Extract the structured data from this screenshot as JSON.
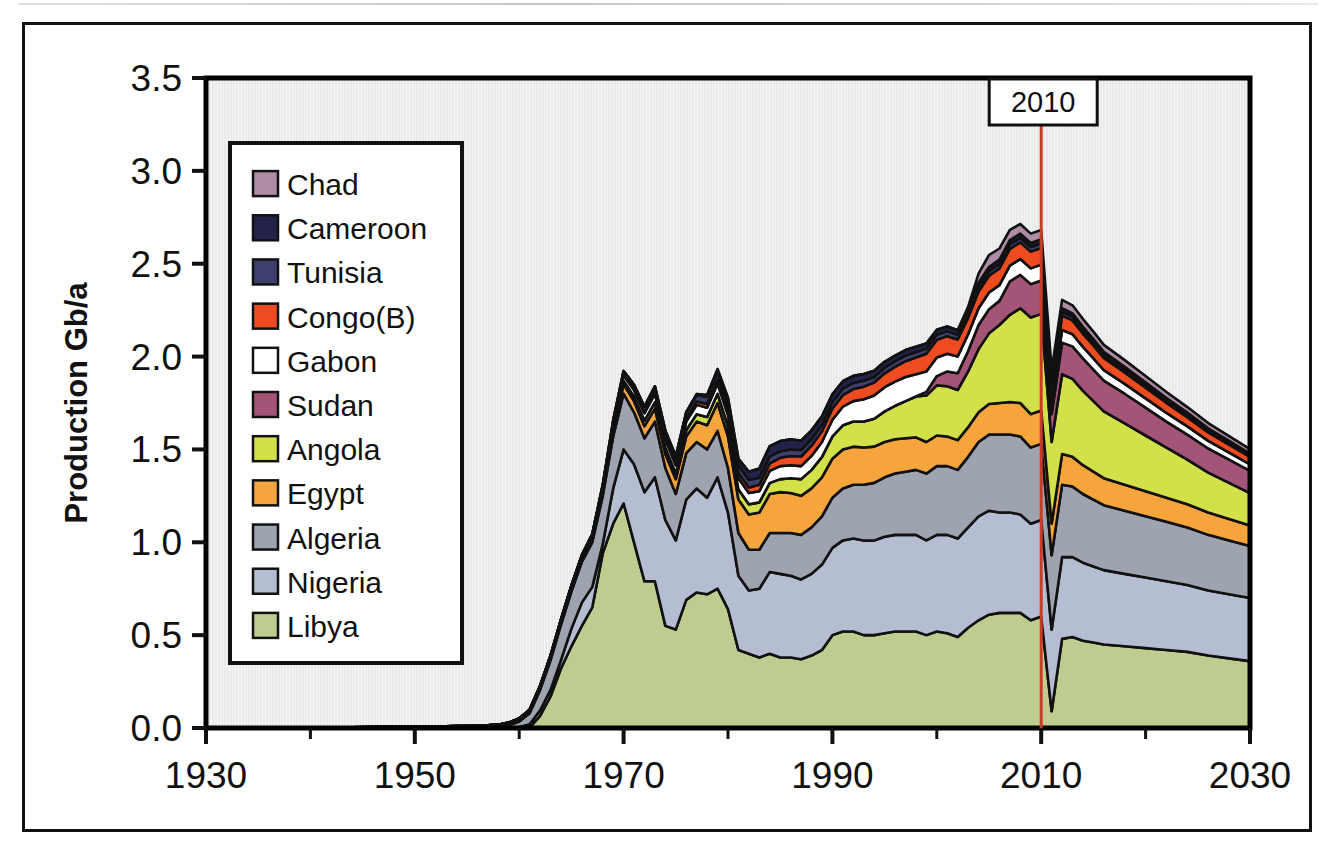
{
  "figure": {
    "background_color": "#ffffff",
    "frame_color": "#111111",
    "plot_background_color": "#e9ebeb",
    "plot_border_color": "#000000"
  },
  "chart_data": {
    "type": "area",
    "stacked": true,
    "title": "",
    "xlabel": "",
    "ylabel": "Production Gb/a",
    "xlim": [
      1930,
      2030
    ],
    "ylim": [
      0.0,
      3.5
    ],
    "grid": false,
    "legend_position": "upper-left-inside",
    "x_major_ticks": [
      1930,
      1950,
      1970,
      1990,
      2010,
      2030
    ],
    "x_minor_ticks": [
      1940,
      1960,
      1980,
      2000,
      2020
    ],
    "x_tick_labels": [
      "1930",
      "1950",
      "1970",
      "1990",
      "2010",
      "2030"
    ],
    "y_ticks": [
      0.0,
      0.5,
      1.0,
      1.5,
      2.0,
      2.5,
      3.0,
      3.5
    ],
    "y_tick_labels": [
      "0.0",
      "0.5",
      "1.0",
      "1.5",
      "2.0",
      "2.5",
      "3.0",
      "3.5"
    ],
    "stack_order_bottom_to_top": [
      "Libya",
      "Nigeria",
      "Algeria",
      "Egypt",
      "Angola",
      "Sudan",
      "Gabon",
      "Congo(B)",
      "Tunisia",
      "Cameroon",
      "Chad"
    ],
    "legend_order_top_to_bottom": [
      "Chad",
      "Cameroon",
      "Tunisia",
      "Congo(B)",
      "Gabon",
      "Sudan",
      "Angola",
      "Egypt",
      "Algeria",
      "Nigeria",
      "Libya"
    ],
    "x": [
      1930,
      1932,
      1934,
      1936,
      1938,
      1940,
      1942,
      1944,
      1946,
      1948,
      1950,
      1952,
      1954,
      1956,
      1957,
      1958,
      1959,
      1960,
      1961,
      1962,
      1963,
      1964,
      1965,
      1966,
      1967,
      1968,
      1969,
      1970,
      1971,
      1972,
      1973,
      1974,
      1975,
      1976,
      1977,
      1978,
      1979,
      1980,
      1981,
      1982,
      1983,
      1984,
      1985,
      1986,
      1987,
      1988,
      1989,
      1990,
      1991,
      1992,
      1993,
      1994,
      1995,
      1996,
      1997,
      1998,
      1999,
      2000,
      2001,
      2002,
      2003,
      2004,
      2005,
      2006,
      2007,
      2008,
      2009,
      2010,
      2011,
      2012,
      2013,
      2014,
      2015,
      2016,
      2018,
      2020,
      2022,
      2024,
      2026,
      2028,
      2030
    ],
    "series": [
      {
        "name": "Libya",
        "color": "#bfcc90",
        "values": [
          0,
          0,
          0,
          0,
          0,
          0,
          0,
          0,
          0,
          0,
          0,
          0,
          0,
          0,
          0,
          0,
          0,
          0,
          0.002,
          0.065,
          0.17,
          0.32,
          0.44,
          0.55,
          0.65,
          0.94,
          1.1,
          1.21,
          1.0,
          0.79,
          0.79,
          0.55,
          0.53,
          0.69,
          0.73,
          0.72,
          0.75,
          0.64,
          0.42,
          0.4,
          0.38,
          0.4,
          0.38,
          0.38,
          0.37,
          0.39,
          0.42,
          0.5,
          0.52,
          0.52,
          0.5,
          0.5,
          0.51,
          0.52,
          0.52,
          0.52,
          0.5,
          0.52,
          0.51,
          0.49,
          0.54,
          0.58,
          0.61,
          0.62,
          0.62,
          0.62,
          0.58,
          0.6,
          0.09,
          0.48,
          0.49,
          0.47,
          0.46,
          0.45,
          0.44,
          0.43,
          0.42,
          0.41,
          0.39,
          0.375,
          0.36
        ]
      },
      {
        "name": "Nigeria",
        "color": "#b4bdd2",
        "values": [
          0,
          0,
          0,
          0,
          0,
          0,
          0,
          0,
          0,
          0,
          0,
          0,
          0,
          0,
          0,
          0,
          0.002,
          0.005,
          0.018,
          0.03,
          0.035,
          0.045,
          0.095,
          0.125,
          0.11,
          0.05,
          0.19,
          0.29,
          0.42,
          0.48,
          0.56,
          0.57,
          0.48,
          0.54,
          0.56,
          0.52,
          0.6,
          0.52,
          0.4,
          0.34,
          0.37,
          0.44,
          0.45,
          0.44,
          0.43,
          0.44,
          0.46,
          0.47,
          0.49,
          0.5,
          0.51,
          0.51,
          0.52,
          0.52,
          0.52,
          0.52,
          0.51,
          0.52,
          0.53,
          0.53,
          0.54,
          0.56,
          0.56,
          0.54,
          0.54,
          0.53,
          0.52,
          0.52,
          0.44,
          0.44,
          0.43,
          0.42,
          0.41,
          0.4,
          0.39,
          0.38,
          0.37,
          0.36,
          0.35,
          0.345,
          0.34
        ]
      },
      {
        "name": "Algeria",
        "color": "#9ea3b0",
        "values": [
          0,
          0,
          0,
          0,
          0,
          0,
          0,
          0,
          0,
          0,
          0,
          0,
          0,
          0,
          0.001,
          0.004,
          0.012,
          0.03,
          0.06,
          0.11,
          0.16,
          0.19,
          0.2,
          0.22,
          0.24,
          0.26,
          0.28,
          0.3,
          0.28,
          0.29,
          0.3,
          0.28,
          0.25,
          0.25,
          0.25,
          0.26,
          0.25,
          0.24,
          0.23,
          0.22,
          0.21,
          0.21,
          0.22,
          0.23,
          0.24,
          0.25,
          0.26,
          0.27,
          0.28,
          0.29,
          0.3,
          0.31,
          0.32,
          0.33,
          0.34,
          0.35,
          0.36,
          0.37,
          0.37,
          0.37,
          0.38,
          0.4,
          0.41,
          0.42,
          0.42,
          0.42,
          0.41,
          0.41,
          0.4,
          0.39,
          0.38,
          0.37,
          0.36,
          0.35,
          0.34,
          0.33,
          0.32,
          0.31,
          0.3,
          0.29,
          0.28
        ]
      },
      {
        "name": "Egypt",
        "color": "#f6a43c",
        "values": [
          0,
          0,
          0,
          0,
          0,
          0.002,
          0.003,
          0.004,
          0.005,
          0.006,
          0.007,
          0.008,
          0.01,
          0.012,
          0.013,
          0.014,
          0.015,
          0.016,
          0.018,
          0.02,
          0.022,
          0.024,
          0.026,
          0.028,
          0.03,
          0.035,
          0.04,
          0.05,
          0.06,
          0.065,
          0.07,
          0.075,
          0.08,
          0.09,
          0.11,
          0.13,
          0.15,
          0.17,
          0.18,
          0.19,
          0.2,
          0.21,
          0.22,
          0.215,
          0.21,
          0.21,
          0.21,
          0.21,
          0.21,
          0.205,
          0.2,
          0.195,
          0.19,
          0.185,
          0.18,
          0.175,
          0.17,
          0.165,
          0.16,
          0.16,
          0.16,
          0.16,
          0.165,
          0.17,
          0.175,
          0.18,
          0.18,
          0.18,
          0.17,
          0.165,
          0.16,
          0.155,
          0.15,
          0.145,
          0.14,
          0.135,
          0.13,
          0.125,
          0.12,
          0.115,
          0.11
        ]
      },
      {
        "name": "Angola",
        "color": "#d2e04a",
        "values": [
          0,
          0,
          0,
          0,
          0,
          0,
          0,
          0,
          0,
          0,
          0,
          0,
          0,
          0,
          0,
          0,
          0,
          0,
          0,
          0,
          0,
          0,
          0,
          0,
          0.002,
          0.005,
          0.01,
          0.02,
          0.025,
          0.03,
          0.035,
          0.035,
          0.03,
          0.035,
          0.04,
          0.045,
          0.05,
          0.055,
          0.055,
          0.055,
          0.055,
          0.06,
          0.07,
          0.08,
          0.09,
          0.1,
          0.11,
          0.12,
          0.13,
          0.135,
          0.14,
          0.15,
          0.165,
          0.18,
          0.2,
          0.22,
          0.25,
          0.27,
          0.27,
          0.27,
          0.3,
          0.34,
          0.38,
          0.42,
          0.47,
          0.51,
          0.52,
          0.52,
          0.44,
          0.43,
          0.42,
          0.4,
          0.38,
          0.36,
          0.33,
          0.3,
          0.27,
          0.24,
          0.215,
          0.195,
          0.175
        ]
      },
      {
        "name": "Sudan",
        "color": "#a45476",
        "values": [
          0,
          0,
          0,
          0,
          0,
          0,
          0,
          0,
          0,
          0,
          0,
          0,
          0,
          0,
          0,
          0,
          0,
          0,
          0,
          0,
          0,
          0,
          0,
          0,
          0,
          0,
          0,
          0,
          0,
          0,
          0,
          0,
          0,
          0,
          0,
          0,
          0,
          0,
          0,
          0,
          0,
          0,
          0,
          0,
          0,
          0,
          0,
          0,
          0,
          0,
          0,
          0,
          0,
          0,
          0,
          0,
          0.02,
          0.05,
          0.08,
          0.09,
          0.11,
          0.13,
          0.13,
          0.13,
          0.18,
          0.18,
          0.18,
          0.18,
          0.15,
          0.17,
          0.175,
          0.175,
          0.17,
          0.165,
          0.16,
          0.15,
          0.14,
          0.135,
          0.13,
          0.125,
          0.12
        ]
      },
      {
        "name": "Gabon",
        "color": "#ffffff",
        "values": [
          0,
          0,
          0,
          0,
          0,
          0,
          0,
          0,
          0,
          0,
          0,
          0,
          0,
          0,
          0,
          0,
          0,
          0,
          0,
          0.002,
          0.003,
          0.004,
          0.005,
          0.006,
          0.008,
          0.01,
          0.02,
          0.03,
          0.035,
          0.04,
          0.045,
          0.045,
          0.045,
          0.045,
          0.05,
          0.05,
          0.055,
          0.06,
          0.06,
          0.06,
          0.06,
          0.065,
          0.07,
          0.07,
          0.07,
          0.075,
          0.08,
          0.09,
          0.1,
          0.11,
          0.12,
          0.125,
          0.13,
          0.13,
          0.13,
          0.12,
          0.11,
          0.1,
          0.095,
          0.09,
          0.09,
          0.09,
          0.09,
          0.085,
          0.085,
          0.085,
          0.085,
          0.085,
          0.07,
          0.068,
          0.065,
          0.062,
          0.06,
          0.057,
          0.053,
          0.05,
          0.047,
          0.044,
          0.041,
          0.038,
          0.035
        ]
      },
      {
        "name": "Congo(B)",
        "color": "#ef4b20",
        "values": [
          0,
          0,
          0,
          0,
          0,
          0,
          0,
          0,
          0,
          0,
          0,
          0,
          0,
          0,
          0,
          0,
          0,
          0,
          0,
          0,
          0,
          0,
          0,
          0,
          0,
          0,
          0,
          0.002,
          0.003,
          0.005,
          0.008,
          0.01,
          0.012,
          0.015,
          0.018,
          0.02,
          0.022,
          0.025,
          0.028,
          0.03,
          0.035,
          0.04,
          0.045,
          0.05,
          0.052,
          0.055,
          0.058,
          0.06,
          0.062,
          0.065,
          0.068,
          0.07,
          0.075,
          0.08,
          0.085,
          0.09,
          0.095,
          0.095,
          0.095,
          0.092,
          0.09,
          0.09,
          0.09,
          0.09,
          0.09,
          0.09,
          0.09,
          0.09,
          0.08,
          0.078,
          0.075,
          0.072,
          0.07,
          0.066,
          0.062,
          0.058,
          0.054,
          0.05,
          0.046,
          0.043,
          0.04
        ]
      },
      {
        "name": "Tunisia",
        "color": "#3d3f6e",
        "values": [
          0,
          0,
          0,
          0,
          0,
          0,
          0,
          0,
          0,
          0,
          0,
          0,
          0,
          0,
          0,
          0,
          0,
          0,
          0,
          0,
          0,
          0,
          0,
          0.002,
          0.004,
          0.008,
          0.015,
          0.02,
          0.025,
          0.03,
          0.032,
          0.035,
          0.035,
          0.035,
          0.035,
          0.038,
          0.04,
          0.042,
          0.042,
          0.04,
          0.038,
          0.038,
          0.035,
          0.035,
          0.035,
          0.035,
          0.035,
          0.035,
          0.035,
          0.033,
          0.032,
          0.03,
          0.03,
          0.03,
          0.03,
          0.03,
          0.028,
          0.028,
          0.027,
          0.026,
          0.025,
          0.025,
          0.025,
          0.025,
          0.025,
          0.025,
          0.025,
          0.025,
          0.022,
          0.021,
          0.02,
          0.019,
          0.018,
          0.017,
          0.016,
          0.015,
          0.014,
          0.013,
          0.012,
          0.011,
          0.01
        ]
      },
      {
        "name": "Cameroon",
        "color": "#23224a",
        "values": [
          0,
          0,
          0,
          0,
          0,
          0,
          0,
          0,
          0,
          0,
          0,
          0,
          0,
          0,
          0,
          0,
          0,
          0,
          0,
          0,
          0,
          0,
          0,
          0,
          0,
          0,
          0,
          0,
          0,
          0,
          0,
          0,
          0,
          0,
          0.005,
          0.01,
          0.015,
          0.025,
          0.035,
          0.045,
          0.05,
          0.055,
          0.055,
          0.055,
          0.05,
          0.048,
          0.045,
          0.042,
          0.04,
          0.038,
          0.036,
          0.034,
          0.032,
          0.03,
          0.03,
          0.028,
          0.027,
          0.026,
          0.025,
          0.024,
          0.023,
          0.022,
          0.022,
          0.022,
          0.022,
          0.022,
          0.022,
          0.022,
          0.02,
          0.019,
          0.018,
          0.017,
          0.016,
          0.015,
          0.014,
          0.013,
          0.012,
          0.011,
          0.01,
          0.009,
          0.008
        ]
      },
      {
        "name": "Chad",
        "color": "#ae8ca6",
        "values": [
          0,
          0,
          0,
          0,
          0,
          0,
          0,
          0,
          0,
          0,
          0,
          0,
          0,
          0,
          0,
          0,
          0,
          0,
          0,
          0,
          0,
          0,
          0,
          0,
          0,
          0,
          0,
          0,
          0,
          0,
          0,
          0,
          0,
          0,
          0,
          0,
          0,
          0,
          0,
          0,
          0,
          0,
          0,
          0,
          0,
          0,
          0,
          0,
          0,
          0,
          0,
          0,
          0,
          0,
          0,
          0,
          0,
          0,
          0,
          0,
          0.01,
          0.05,
          0.065,
          0.06,
          0.055,
          0.052,
          0.05,
          0.05,
          0.045,
          0.044,
          0.043,
          0.042,
          0.04,
          0.038,
          0.036,
          0.034,
          0.032,
          0.03,
          0.028,
          0.026,
          0.024
        ]
      }
    ],
    "annotations": [
      {
        "name": "year-marker",
        "label": "2010",
        "x": 2010,
        "line_color": "#cc3b28",
        "box_fill": "#ffffff",
        "box_border": "#111111"
      }
    ]
  },
  "legend": {
    "items": [
      {
        "label": "Chad",
        "color": "#ae8ca6"
      },
      {
        "label": "Cameroon",
        "color": "#23224a"
      },
      {
        "label": "Tunisia",
        "color": "#3d3f6e"
      },
      {
        "label": "Congo(B)",
        "color": "#ef4b20"
      },
      {
        "label": "Gabon",
        "color": "#ffffff"
      },
      {
        "label": "Sudan",
        "color": "#a45476"
      },
      {
        "label": "Angola",
        "color": "#d2e04a"
      },
      {
        "label": "Egypt",
        "color": "#f6a43c"
      },
      {
        "label": "Algeria",
        "color": "#9ea3b0"
      },
      {
        "label": "Nigeria",
        "color": "#b4bdd2"
      },
      {
        "label": "Libya",
        "color": "#bfcc90"
      }
    ]
  }
}
